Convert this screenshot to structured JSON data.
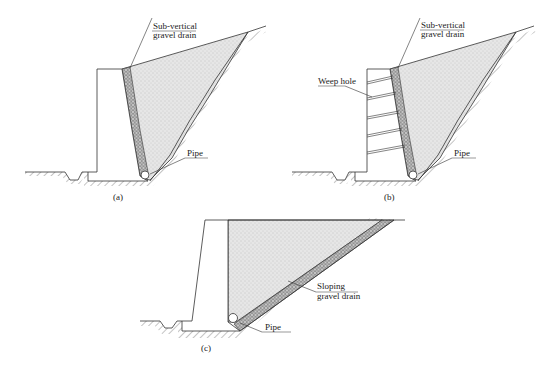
{
  "figure": {
    "panels": [
      {
        "id": "a",
        "caption": "(a)",
        "labels": {
          "drain_line1": "Sub-vertical",
          "drain_line2": "gravel drain",
          "pipe": "Pipe"
        }
      },
      {
        "id": "b",
        "caption": "(b)",
        "labels": {
          "drain_line1": "Sub-vertical",
          "drain_line2": "gravel drain",
          "weep_hole": "Weep hole",
          "pipe": "Pipe"
        }
      },
      {
        "id": "c",
        "caption": "(c)",
        "labels": {
          "drain_line1": "Sloping",
          "drain_line2": "gravel drain",
          "pipe": "Pipe"
        }
      }
    ],
    "colors": {
      "line": "#333333",
      "backfill": "#e4e4e4",
      "drain": "#bdbdbd",
      "background": "#ffffff"
    }
  }
}
